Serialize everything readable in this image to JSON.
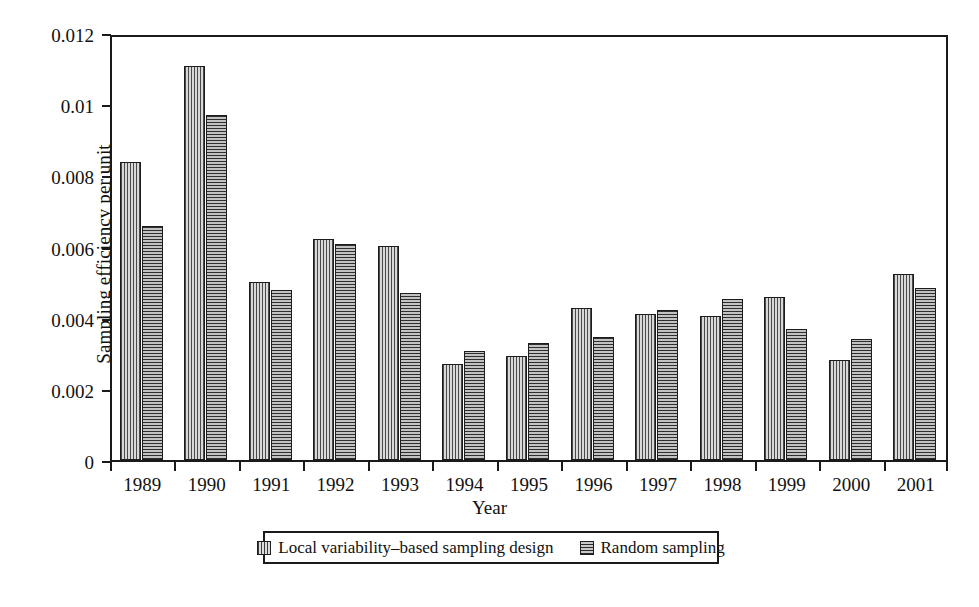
{
  "chart_data": {
    "type": "bar",
    "title": "",
    "xlabel": "Year",
    "ylabel": "Sampling efficiency per unit",
    "categories": [
      "1989",
      "1990",
      "1991",
      "1992",
      "1993",
      "1994",
      "1995",
      "1996",
      "1997",
      "1998",
      "1999",
      "2000",
      "2001"
    ],
    "ylim": [
      0,
      0.012
    ],
    "ytick_labels": [
      "0",
      "0.002",
      "0.004",
      "0.006",
      "0.008",
      "0.01",
      "0.012"
    ],
    "ytick_values": [
      0,
      0.002,
      0.004,
      0.006,
      0.008,
      0.01,
      0.012
    ],
    "grid": false,
    "legend_position": "bottom-center",
    "series": [
      {
        "name": "Local variability–based sampling design",
        "pattern": "vertical-hatch",
        "values": [
          0.00837,
          0.01106,
          0.005,
          0.00622,
          0.00602,
          0.00269,
          0.00291,
          0.00426,
          0.0041,
          0.00406,
          0.00458,
          0.00281,
          0.00524
        ]
      },
      {
        "name": "Random sampling",
        "pattern": "horizontal-hatch",
        "values": [
          0.00657,
          0.00969,
          0.00477,
          0.00608,
          0.00468,
          0.00306,
          0.00329,
          0.00347,
          0.00421,
          0.00452,
          0.00368,
          0.00341,
          0.00484
        ]
      }
    ]
  },
  "legend": {
    "entries": [
      {
        "label": "Local variability–based sampling design"
      },
      {
        "label": "Random sampling"
      }
    ]
  }
}
